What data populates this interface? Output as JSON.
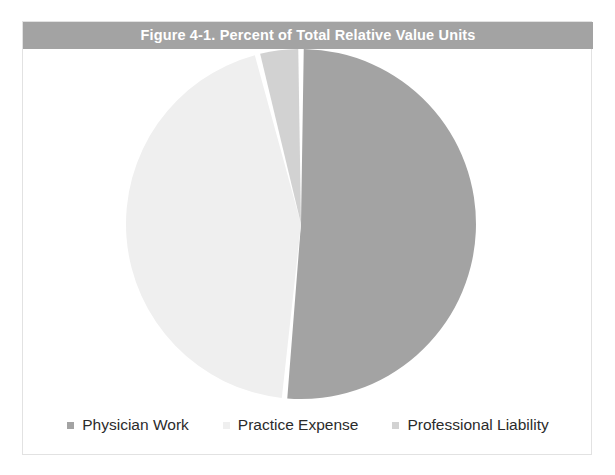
{
  "figure": {
    "title": "Figure 4-1. Percent of Total Relative Value Units",
    "banner_color": "#a3a3a3",
    "title_color": "#ffffff",
    "background_color": "#ffffff",
    "border_color": "#e2e2e2"
  },
  "chart_data": {
    "type": "pie",
    "title": "Figure 4-1. Percent of Total Relative Value Units",
    "xlabel": "",
    "ylabel": "",
    "legend_position": "bottom",
    "grid": false,
    "start_angle_deg": 0,
    "direction": "clockwise",
    "categories": [
      "Physician Work",
      "Practice Expense",
      "Professional Liability"
    ],
    "values": [
      51.5,
      44.5,
      4.0
    ],
    "unit": "percent",
    "colors": [
      "#a3a3a3",
      "#efefef",
      "#d2d2d2"
    ],
    "slices": [
      {
        "label": "Physician Work",
        "value": 51.5,
        "color": "#a3a3a3",
        "start_deg": 0,
        "sweep_deg": 185.4
      },
      {
        "label": "Practice Expense",
        "value": 44.5,
        "color": "#efefef",
        "start_deg": 185.4,
        "sweep_deg": 160.2
      },
      {
        "label": "Professional Liability",
        "value": 4.0,
        "color": "#d2d2d2",
        "start_deg": 345.6,
        "sweep_deg": 14.4
      }
    ]
  },
  "legend": {
    "items": [
      {
        "label": "Physician Work",
        "color": "#a3a3a3"
      },
      {
        "label": "Practice Expense",
        "color": "#efefef"
      },
      {
        "label": "Professional Liability",
        "color": "#d2d2d2"
      }
    ]
  }
}
